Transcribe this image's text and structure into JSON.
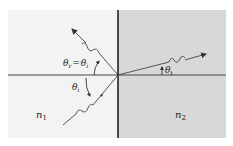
{
  "diagram": {
    "colors": {
      "medium1": "#f2f2f2",
      "medium2": "#d9d9d9",
      "lines": "#2a2a2a",
      "rays": "#444444"
    },
    "media": [
      {
        "id": "medium-1",
        "label": "n",
        "subscript": "1"
      },
      {
        "id": "medium-2",
        "label": "n",
        "subscript": "2"
      }
    ],
    "angles": {
      "reflected": {
        "label": "θ",
        "subscript": "r",
        "equals": "=",
        "rhs": "θ",
        "rhs_subscript": "i"
      },
      "incident": {
        "label": "θ",
        "subscript": "i"
      },
      "transmitted": {
        "label": "θ",
        "subscript": "t"
      }
    },
    "rays": [
      {
        "name": "incident-ray",
        "direction": "toward interface from lower-left"
      },
      {
        "name": "reflected-ray",
        "direction": "away from interface to upper-left"
      },
      {
        "name": "transmitted-ray",
        "direction": "into medium 2 toward upper-right"
      }
    ]
  }
}
